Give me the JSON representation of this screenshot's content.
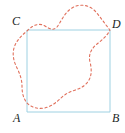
{
  "figure": {
    "kind": "geometry-diagram",
    "canvas": {
      "width": 125,
      "height": 133
    },
    "colors": {
      "square_stroke": "#9ed1e2",
      "square_fill": "#ffffff",
      "curve_stroke": "#e0705c",
      "label_color": "#221f1f",
      "background": "#ffffff"
    },
    "square": {
      "name": "square-ABCD",
      "stroke_width": 1,
      "dash": "solid",
      "corners": {
        "A": {
          "x": 27,
          "y": 112
        },
        "B": {
          "x": 110,
          "y": 112
        },
        "C": {
          "x": 27,
          "y": 30
        },
        "D": {
          "x": 110,
          "y": 30
        }
      },
      "path": "M 27 30 L 110 30 L 110 112 L 27 112 Z"
    },
    "curve": {
      "name": "dashed-region-curve",
      "stroke_width": 1.1,
      "dash": "2.2 2.6",
      "closed": true,
      "path": "M 27 31 C 34 24 40 23 45 26 C 50 29 53 31 57 27 C 61 22 64 13 72 8 C 80 3 90 5 96 12 C 101 18 105 24 110 30 C 107 36 102 40 97 44 C 92 48 88 54 90 62 C 92 70 92 78 86 84 C 80 90 72 90 66 94 C 60 98 56 104 48 107 C 40 110 32 108 27 103 C 23 98 22 92 22 86 C 22 80 20 74 17 68 C 14 62 12 55 14 48 C 16 41 21 36 27 31 Z"
    },
    "labels": [
      {
        "id": "A",
        "text": "A",
        "x": 13,
        "y": 112
      },
      {
        "id": "B",
        "text": "B",
        "x": 112,
        "y": 112
      },
      {
        "id": "C",
        "text": "C",
        "x": 12,
        "y": 15
      },
      {
        "id": "D",
        "text": "D",
        "x": 112,
        "y": 18
      }
    ]
  }
}
